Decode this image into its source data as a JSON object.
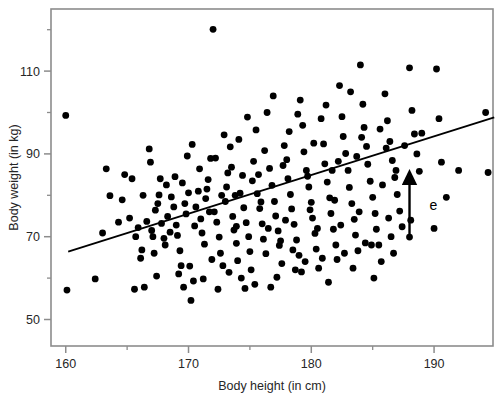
{
  "chart_data": {
    "type": "scatter",
    "title": "",
    "xlabel": "Body height (in cm)",
    "ylabel": "Body weight (in kg)",
    "xlim": [
      158.8,
      194.8
    ],
    "ylim": [
      43.6,
      125.0
    ],
    "xticks": [
      160,
      170,
      180,
      190
    ],
    "xticklabels": [
      "160",
      "170",
      "180",
      "190"
    ],
    "xminorticks": [
      165,
      175,
      185
    ],
    "yticks": [
      50,
      70,
      90,
      110
    ],
    "yticklabels": [
      "50",
      "70",
      "90",
      "110"
    ],
    "yminorticks": [
      60,
      80,
      100,
      120
    ],
    "grid": false,
    "legend": null,
    "marker": {
      "shape": "circle",
      "color": "#000000",
      "size": 4.6
    },
    "regression_line": {
      "label": "",
      "color": "#000000",
      "x": [
        160.2,
        194.9
      ],
      "y": [
        66.4,
        98.8
      ]
    },
    "annotations": [
      {
        "type": "arrow",
        "text": "e",
        "text_x": 188.9,
        "text_y": 76.5,
        "from_x": 188.0,
        "from_y": 69.9,
        "to_x": 188.0,
        "to_y": 84.5
      }
    ],
    "points": [
      [
        160.0,
        99.3
      ],
      [
        160.1,
        57.1
      ],
      [
        162.4,
        59.8
      ],
      [
        163.0,
        70.9
      ],
      [
        163.3,
        86.4
      ],
      [
        163.6,
        79.9
      ],
      [
        164.3,
        73.5
      ],
      [
        164.6,
        78.9
      ],
      [
        164.8,
        85.0
      ],
      [
        165.2,
        74.5
      ],
      [
        165.4,
        84.0
      ],
      [
        165.6,
        57.3
      ],
      [
        165.9,
        72.2
      ],
      [
        166.1,
        64.8
      ],
      [
        166.2,
        66.8
      ],
      [
        166.4,
        57.8
      ],
      [
        166.6,
        73.7
      ],
      [
        166.8,
        91.2
      ],
      [
        167.0,
        71.5
      ],
      [
        167.1,
        70.0
      ],
      [
        167.3,
        76.4
      ],
      [
        167.5,
        78.0
      ],
      [
        167.6,
        80.1
      ],
      [
        167.8,
        73.2
      ],
      [
        168.0,
        69.6
      ],
      [
        168.1,
        68.0
      ],
      [
        168.3,
        74.9
      ],
      [
        168.5,
        71.1
      ],
      [
        168.6,
        79.6
      ],
      [
        168.8,
        77.2
      ],
      [
        169.0,
        72.8
      ],
      [
        169.1,
        70.3
      ],
      [
        169.3,
        66.6
      ],
      [
        169.4,
        63.0
      ],
      [
        169.6,
        57.8
      ],
      [
        169.8,
        75.5
      ],
      [
        170.0,
        80.6
      ],
      [
        170.1,
        62.9
      ],
      [
        170.2,
        54.6
      ],
      [
        170.4,
        59.3
      ],
      [
        170.5,
        72.6
      ],
      [
        170.6,
        77.2
      ],
      [
        170.8,
        81.0
      ],
      [
        171.0,
        74.3
      ],
      [
        171.1,
        70.9
      ],
      [
        171.3,
        68.2
      ],
      [
        171.4,
        79.2
      ],
      [
        171.6,
        83.8
      ],
      [
        171.8,
        88.9
      ],
      [
        172.0,
        120.1
      ],
      [
        172.1,
        76.0
      ],
      [
        172.3,
        73.5
      ],
      [
        172.5,
        69.9
      ],
      [
        172.6,
        66.0
      ],
      [
        172.8,
        63.0
      ],
      [
        173.0,
        78.5
      ],
      [
        173.1,
        82.0
      ],
      [
        173.2,
        85.4
      ],
      [
        173.4,
        91.7
      ],
      [
        173.6,
        74.9
      ],
      [
        173.7,
        71.6
      ],
      [
        173.9,
        68.4
      ],
      [
        174.0,
        64.2
      ],
      [
        174.2,
        80.5
      ],
      [
        174.4,
        84.8
      ],
      [
        174.5,
        77.0
      ],
      [
        174.7,
        73.4
      ],
      [
        174.9,
        70.0
      ],
      [
        175.0,
        66.4
      ],
      [
        175.1,
        62.0
      ],
      [
        175.3,
        88.2
      ],
      [
        175.5,
        95.8
      ],
      [
        175.6,
        80.4
      ],
      [
        175.8,
        76.8
      ],
      [
        176.0,
        73.1
      ],
      [
        176.1,
        69.4
      ],
      [
        176.3,
        65.9
      ],
      [
        176.4,
        100.0
      ],
      [
        176.6,
        86.5
      ],
      [
        176.8,
        82.4
      ],
      [
        177.0,
        78.5
      ],
      [
        177.1,
        75.0
      ],
      [
        177.3,
        71.4
      ],
      [
        177.4,
        67.9
      ],
      [
        177.6,
        63.5
      ],
      [
        177.8,
        92.0
      ],
      [
        178.0,
        88.6
      ],
      [
        178.1,
        84.0
      ],
      [
        178.3,
        80.2
      ],
      [
        178.4,
        76.7
      ],
      [
        178.6,
        73.0
      ],
      [
        178.8,
        69.2
      ],
      [
        179.0,
        65.5
      ],
      [
        179.1,
        103.0
      ],
      [
        179.3,
        96.9
      ],
      [
        179.4,
        90.5
      ],
      [
        179.6,
        86.0
      ],
      [
        179.8,
        82.0
      ],
      [
        180.0,
        78.3
      ],
      [
        180.1,
        74.5
      ],
      [
        180.3,
        70.8
      ],
      [
        180.4,
        67.0
      ],
      [
        180.6,
        62.4
      ],
      [
        180.8,
        98.5
      ],
      [
        181.0,
        92.4
      ],
      [
        181.1,
        87.6
      ],
      [
        181.3,
        83.2
      ],
      [
        181.5,
        79.4
      ],
      [
        181.6,
        75.6
      ],
      [
        181.8,
        71.8
      ],
      [
        182.0,
        68.0
      ],
      [
        182.1,
        64.5
      ],
      [
        182.3,
        106.5
      ],
      [
        182.5,
        99.0
      ],
      [
        182.6,
        94.2
      ],
      [
        182.8,
        90.1
      ],
      [
        183.0,
        86.0
      ],
      [
        183.1,
        81.9
      ],
      [
        183.3,
        78.0
      ],
      [
        183.5,
        74.2
      ],
      [
        183.6,
        70.4
      ],
      [
        183.8,
        66.6
      ],
      [
        184.0,
        111.5
      ],
      [
        184.2,
        102.0
      ],
      [
        184.3,
        96.4
      ],
      [
        184.5,
        91.8
      ],
      [
        184.6,
        87.5
      ],
      [
        184.8,
        83.4
      ],
      [
        185.0,
        79.5
      ],
      [
        185.2,
        75.6
      ],
      [
        185.3,
        71.8
      ],
      [
        185.5,
        68.0
      ],
      [
        185.7,
        64.0
      ],
      [
        186.0,
        104.5
      ],
      [
        186.2,
        98.0
      ],
      [
        186.4,
        93.0
      ],
      [
        186.6,
        88.4
      ],
      [
        186.8,
        84.3
      ],
      [
        187.0,
        80.2
      ],
      [
        187.2,
        76.2
      ],
      [
        187.4,
        72.4
      ],
      [
        188.0,
        110.8
      ],
      [
        188.2,
        100.5
      ],
      [
        188.4,
        94.8
      ],
      [
        188.6,
        90.0
      ],
      [
        188.8,
        85.8
      ],
      [
        190.2,
        110.5
      ],
      [
        190.4,
        98.5
      ],
      [
        190.6,
        88.0
      ],
      [
        191.0,
        79.5
      ],
      [
        194.2,
        100.0
      ],
      [
        194.4,
        85.5
      ],
      [
        166.9,
        88.0
      ],
      [
        168.9,
        84.5
      ],
      [
        170.9,
        86.4
      ],
      [
        172.9,
        94.6
      ],
      [
        174.8,
        98.9
      ],
      [
        176.9,
        104.0
      ],
      [
        178.9,
        99.6
      ],
      [
        181.2,
        101.8
      ],
      [
        183.2,
        105.0
      ],
      [
        185.6,
        96.0
      ],
      [
        187.6,
        92.0
      ],
      [
        167.4,
        60.5
      ],
      [
        169.2,
        61.0
      ],
      [
        171.2,
        59.8
      ],
      [
        173.3,
        61.4
      ],
      [
        175.4,
        58.5
      ],
      [
        177.2,
        60.2
      ],
      [
        179.2,
        61.5
      ],
      [
        181.4,
        59.0
      ],
      [
        183.4,
        62.4
      ],
      [
        185.1,
        60.0
      ],
      [
        170.3,
        92.3
      ],
      [
        172.2,
        89.0
      ],
      [
        174.1,
        93.5
      ],
      [
        176.2,
        90.8
      ],
      [
        178.2,
        95.4
      ],
      [
        180.2,
        92.6
      ],
      [
        182.2,
        88.2
      ],
      [
        184.1,
        94.0
      ],
      [
        186.1,
        91.4
      ],
      [
        169.5,
        83.0
      ],
      [
        171.5,
        81.5
      ],
      [
        173.5,
        86.8
      ],
      [
        175.7,
        85.0
      ],
      [
        177.7,
        87.2
      ],
      [
        179.7,
        84.6
      ],
      [
        181.7,
        86.0
      ],
      [
        183.7,
        89.4
      ],
      [
        185.8,
        82.5
      ],
      [
        168.2,
        82.5
      ],
      [
        166.3,
        80.0
      ],
      [
        167.7,
        84.0
      ],
      [
        169.7,
        78.0
      ],
      [
        171.7,
        76.0
      ],
      [
        173.8,
        80.0
      ],
      [
        175.9,
        78.4
      ],
      [
        177.9,
        74.0
      ],
      [
        179.9,
        76.5
      ],
      [
        181.9,
        78.8
      ],
      [
        183.9,
        76.0
      ],
      [
        186.3,
        74.5
      ],
      [
        171.9,
        64.5
      ],
      [
        173.9,
        72.5
      ],
      [
        176.5,
        72.0
      ],
      [
        178.5,
        66.8
      ],
      [
        180.5,
        72.0
      ],
      [
        182.4,
        72.8
      ],
      [
        184.4,
        68.5
      ],
      [
        186.5,
        70.0
      ],
      [
        174.3,
        60.0
      ],
      [
        179.5,
        64.0
      ],
      [
        177.5,
        69.0
      ],
      [
        189.0,
        95.0
      ],
      [
        188.1,
        74.0
      ],
      [
        190.0,
        72.0
      ],
      [
        192.0,
        86.0
      ],
      [
        169.9,
        89.5
      ],
      [
        172.7,
        80.0
      ],
      [
        175.2,
        83.5
      ],
      [
        167.2,
        66.0
      ],
      [
        165.7,
        70.0
      ],
      [
        184.9,
        68.0
      ],
      [
        186.9,
        86.0
      ],
      [
        182.7,
        66.0
      ],
      [
        180.9,
        64.8
      ],
      [
        178.7,
        62.0
      ],
      [
        176.7,
        57.8
      ],
      [
        174.6,
        57.5
      ],
      [
        172.4,
        57.3
      ],
      [
        186.7,
        66.0
      ]
    ]
  }
}
